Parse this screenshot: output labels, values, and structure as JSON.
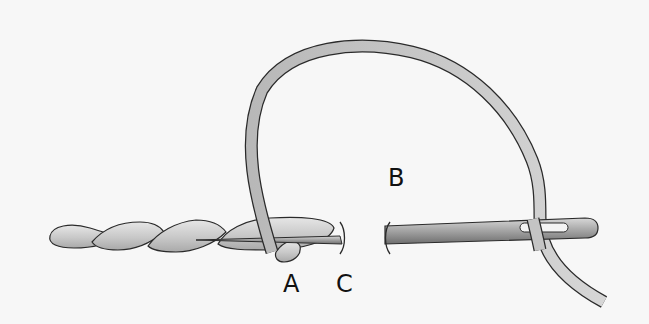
{
  "diagram": {
    "colors": {
      "background": "#f7f7f7",
      "thread_fill": "#c9c9c9",
      "thread_highlight": "#e4e4e4",
      "outline": "#2a2a2a",
      "needle_fill": "#9a9a9a"
    },
    "labels": {
      "a": "A",
      "b": "B",
      "c": "C"
    },
    "elements": [
      "worked-stitch-twist",
      "working-thread-loop",
      "needle",
      "needle-eye",
      "fabric-gap-marks"
    ]
  }
}
